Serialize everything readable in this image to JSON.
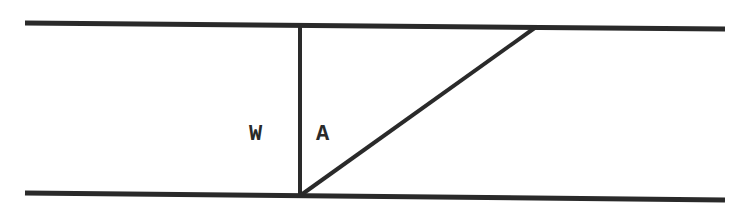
{
  "diagram": {
    "labels": {
      "left": "W",
      "right": "A"
    },
    "colors": {
      "line": "#2a2a2a",
      "background": "#ffffff"
    }
  }
}
